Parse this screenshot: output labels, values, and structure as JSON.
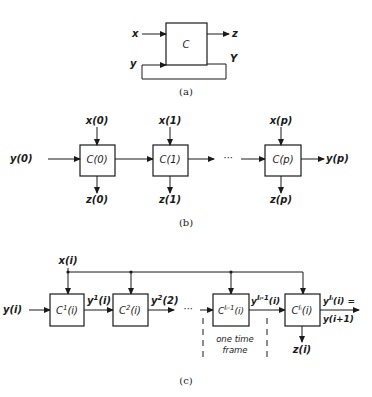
{
  "panel_a": {
    "caption": "(a)",
    "block": "C",
    "input_x": "x",
    "input_y": "y",
    "output_z": "z",
    "output_Y": "Y"
  },
  "panel_b": {
    "caption": "(b)",
    "ellipsis": "···",
    "blocks": [
      {
        "label": "C(0)",
        "x_in": "x(0)",
        "z_out": "z(0)"
      },
      {
        "label": "C(1)",
        "x_in": "x(1)",
        "z_out": "z(1)"
      },
      {
        "label": "C(p)",
        "x_in": "x(p)",
        "z_out": "z(p)"
      }
    ],
    "y_in": "y(0)",
    "y_out": "y(p)"
  },
  "panel_c": {
    "caption": "(c)",
    "x_in": "x(i)",
    "y_in": "y(i)",
    "ellipsis": "···",
    "blocks": [
      {
        "base": "C",
        "sup": "1",
        "arg": "(i)"
      },
      {
        "base": "C",
        "sup": "2",
        "arg": "(i)"
      },
      {
        "base": "C",
        "sup": "Iᵢ-1",
        "arg": "(i)"
      },
      {
        "base": "C",
        "sup": "Iᵢ",
        "arg": "(i)"
      }
    ],
    "links": [
      {
        "base": "y",
        "sup": "1",
        "arg": "(i)"
      },
      {
        "base": "y",
        "sup": "2",
        "arg": "(2)"
      },
      {
        "base": "y",
        "sup": "Iᵢ-1",
        "arg": "(i)"
      }
    ],
    "output_line1": {
      "base": "y",
      "sup": "Iᵢ",
      "arg": "(i) ="
    },
    "output_line2": "y(i+1)",
    "z_out": "z(i)",
    "frame_note_line1": "one time",
    "frame_note_line2": "frame"
  }
}
